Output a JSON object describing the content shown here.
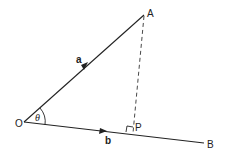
{
  "diagram": {
    "points": {
      "O": {
        "label": "O",
        "x": 24,
        "y": 122
      },
      "A": {
        "label": "A",
        "x": 144,
        "y": 15
      },
      "P": {
        "label": "P",
        "x": 133,
        "y": 133
      },
      "B": {
        "label": "B",
        "x": 204,
        "y": 143
      }
    },
    "vectors": {
      "a": {
        "label": "a",
        "from": "O",
        "to": "A"
      },
      "b": {
        "label": "b",
        "from": "O",
        "to": "B"
      }
    },
    "angle": {
      "label": "θ",
      "vertex": "O"
    },
    "perpendicular": {
      "from": "A",
      "foot": "P",
      "style": "dashed"
    },
    "line_color": "#222222"
  }
}
